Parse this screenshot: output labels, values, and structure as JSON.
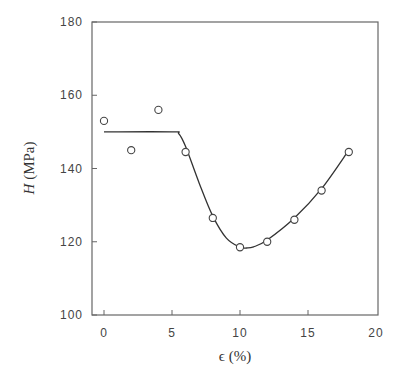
{
  "chart_data": {
    "type": "scatter",
    "title": "",
    "xlabel": "ϵ (%)",
    "ylabel_italic": "H",
    "ylabel_unit": "(MPa)",
    "ylabel": "H (MPa)",
    "xlim": [
      -1,
      20
    ],
    "ylim": [
      100,
      180
    ],
    "xticks": [
      0,
      5,
      10,
      15,
      20
    ],
    "yticks": [
      100,
      120,
      140,
      160,
      180
    ],
    "grid": false,
    "legend": null,
    "series": [
      {
        "name": "measured",
        "marker": "open-circle",
        "x": [
          0,
          2,
          4,
          6,
          8,
          10,
          12,
          14,
          16,
          18
        ],
        "y": [
          153,
          145,
          156,
          144.5,
          126.5,
          118.5,
          120,
          126,
          134,
          144.5
        ]
      },
      {
        "name": "fit",
        "style": "line",
        "x": [
          0,
          5,
          5.5,
          6,
          7,
          8,
          9,
          10,
          10.5,
          11,
          12,
          14,
          16,
          18
        ],
        "y": [
          150,
          150,
          149.5,
          146,
          136,
          127,
          121,
          118.5,
          118.3,
          118.6,
          120.5,
          126.5,
          134.5,
          145
        ]
      }
    ]
  }
}
